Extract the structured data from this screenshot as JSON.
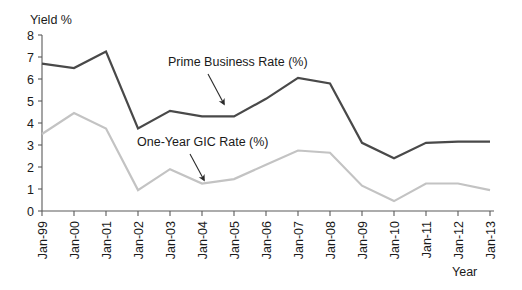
{
  "chart_data": {
    "type": "line",
    "title": "",
    "xlabel": "Year",
    "ylabel": "Yield %",
    "ylim": [
      0,
      8
    ],
    "ytick_labels": [
      "0",
      "1",
      "2",
      "3",
      "4",
      "5",
      "6",
      "7",
      "8"
    ],
    "ytick_values": [
      0,
      1,
      2,
      3,
      4,
      5,
      6,
      7,
      8
    ],
    "grid": false,
    "legend": "annotations-inline",
    "categories": [
      "Jan-99",
      "Jan-00",
      "Jan-01",
      "Jan-02",
      "Jan-03",
      "Jan-04",
      "Jan-05",
      "Jan-06",
      "Jan-07",
      "Jan-08",
      "Jan-09",
      "Jan-10",
      "Jan-11",
      "Jan-12",
      "Jan-13"
    ],
    "series": [
      {
        "name": "Prime Business Rate (%)",
        "color": "#494949",
        "width": 2.2,
        "values": [
          6.7,
          6.5,
          7.25,
          3.75,
          4.55,
          4.3,
          4.3,
          5.1,
          6.05,
          5.8,
          3.1,
          2.4,
          3.1,
          3.15,
          3.15
        ]
      },
      {
        "name": "One-Year GIC Rate (%)",
        "color": "#c3c3c3",
        "width": 2.2,
        "values": [
          3.5,
          4.45,
          3.75,
          0.95,
          1.9,
          1.25,
          1.45,
          2.1,
          2.75,
          2.65,
          1.15,
          0.45,
          1.25,
          1.25,
          0.95
        ]
      }
    ],
    "annotations": [
      {
        "text": "Prime Business Rate (%)",
        "text_x": 168,
        "text_y": 66,
        "arrow_from": [
          208,
          74
        ],
        "arrow_to": [
          224,
          104
        ]
      },
      {
        "text": "One-Year GIC Rate (%)",
        "text_x": 137,
        "text_y": 146,
        "arrow_from": [
          190,
          154
        ],
        "arrow_to": [
          204,
          180
        ]
      }
    ]
  },
  "axis": {
    "y_title": "Yield %",
    "x_title": "Year"
  }
}
